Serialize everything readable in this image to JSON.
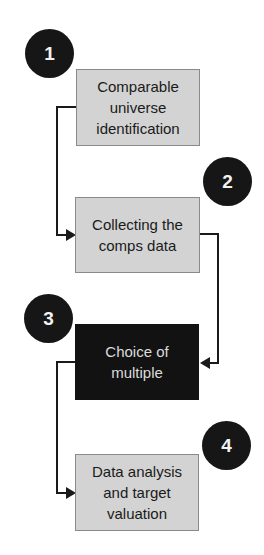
{
  "diagram": {
    "type": "process-flow",
    "steps": [
      {
        "number": "1",
        "label": "Comparable universe identification",
        "lines": [
          "Comparable",
          "universe",
          "identification"
        ],
        "style": "light"
      },
      {
        "number": "2",
        "label": "Collecting the comps data",
        "lines": [
          "Collecting the",
          "comps data"
        ],
        "style": "light"
      },
      {
        "number": "3",
        "label": "Choice of multiple",
        "lines": [
          "Choice of",
          "multiple"
        ],
        "style": "dark"
      },
      {
        "number": "4",
        "label": "Data analysis and target valuation",
        "lines": [
          "Data analysis",
          "and target",
          "valuation"
        ],
        "style": "light"
      }
    ],
    "connections": [
      {
        "from": "1",
        "to": "2"
      },
      {
        "from": "2",
        "to": "3"
      },
      {
        "from": "3",
        "to": "4"
      }
    ],
    "colors": {
      "box_fill": "#d3d3d3",
      "highlight_fill": "#121212",
      "badge_fill": "#161616",
      "line": "#1a1a1a"
    }
  }
}
